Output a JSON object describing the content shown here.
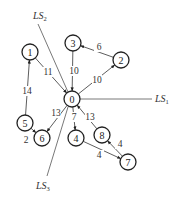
{
  "diagram": {
    "nodes": [
      {
        "id": "0",
        "x": 72,
        "y": 99
      },
      {
        "id": "1",
        "x": 30,
        "y": 52
      },
      {
        "id": "2",
        "x": 121,
        "y": 60
      },
      {
        "id": "3",
        "x": 73,
        "y": 43
      },
      {
        "id": "4",
        "x": 76,
        "y": 138
      },
      {
        "id": "5",
        "x": 25,
        "y": 123
      },
      {
        "id": "6",
        "x": 42,
        "y": 138
      },
      {
        "id": "7",
        "x": 128,
        "y": 162
      },
      {
        "id": "8",
        "x": 102,
        "y": 135
      }
    ],
    "edges": [
      {
        "from": "1",
        "to": "0",
        "weight": "11",
        "lx": 48,
        "ly": 72
      },
      {
        "from": "3",
        "to": "0",
        "weight": "10",
        "lx": 74,
        "ly": 71
      },
      {
        "from": "0",
        "to": "2",
        "weight": "10",
        "lx": 97,
        "ly": 80
      },
      {
        "from": "2",
        "to": "3",
        "weight": "6",
        "lx": 99,
        "ly": 47
      },
      {
        "from": "5",
        "to": "1",
        "weight": "14",
        "lx": 27,
        "ly": 91
      },
      {
        "from": "5",
        "to": "6",
        "weight": "2",
        "lx": 26,
        "ly": 140
      },
      {
        "from": "0",
        "to": "6",
        "weight": "13",
        "lx": 56,
        "ly": 113
      },
      {
        "from": "0",
        "to": "4",
        "weight": "7",
        "lx": 74,
        "ly": 117
      },
      {
        "from": "8",
        "to": "0",
        "weight": "13",
        "lx": 90,
        "ly": 117
      },
      {
        "from": "7",
        "to": "8",
        "weight": "4",
        "lx": 120,
        "ly": 144
      },
      {
        "from": "4",
        "to": "7",
        "weight": "4",
        "lx": 99,
        "ly": 155
      }
    ],
    "lines": [
      {
        "name": "LS",
        "sub": "1",
        "x1": 80,
        "y1": 99,
        "x2": 152,
        "y2": 99,
        "lx": 155,
        "ly": 102
      },
      {
        "name": "LS",
        "sub": "2",
        "x1": 38,
        "y1": 24,
        "x2": 68,
        "y2": 92,
        "lx": 33,
        "ly": 19
      },
      {
        "name": "LS",
        "sub": "3",
        "x1": 68,
        "y1": 107,
        "x2": 47,
        "y2": 176,
        "lx": 36,
        "ly": 189
      }
    ]
  }
}
